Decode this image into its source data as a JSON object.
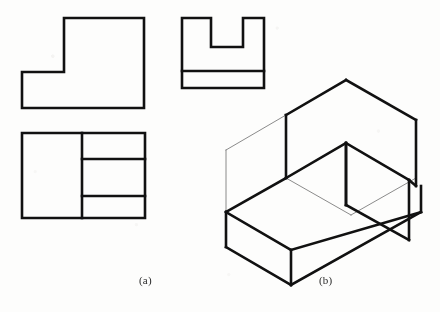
{
  "figure": {
    "kind": "engineering-drawing",
    "background_color": "#fdfdfc",
    "line_color": "#111111",
    "thick_stroke": 2.6,
    "thin_stroke": 0.8
  },
  "captions": {
    "a": "(a)",
    "b": "(b)"
  },
  "orthographic_views": {
    "front_view": {
      "name": "front-view-L-shape",
      "outline_points": "22,72 22,108 144,108 144,18 64,18 64,72",
      "closed": true
    },
    "side_view": {
      "name": "side-view-U-shape",
      "outline_points": "182,18 182,88 264,88 264,18 243,18 243,47 211,47 211,18",
      "closed": true,
      "internal_lines": [
        {
          "name": "horizontal-divider",
          "points": "182,71 264,71"
        }
      ]
    },
    "top_view": {
      "name": "top-view-rectangle",
      "outline_points": "22,133 145,133 145,218 22,218",
      "closed": true,
      "internal_lines": [
        {
          "name": "vertical-divider",
          "points": "82,133 82,218"
        },
        {
          "name": "horizontal-line-upper",
          "points": "82,159 145,159"
        },
        {
          "name": "horizontal-line-lower",
          "points": "82,196 145,196"
        }
      ]
    }
  },
  "isometric_view": {
    "name": "isometric-block-with-slot",
    "solid_edges": [
      {
        "name": "top-rear-left-edge",
        "points": "286,115 346,80"
      },
      {
        "name": "top-ridge-upper",
        "points": "346,80 416,120"
      },
      {
        "name": "slot-top-left-front",
        "points": "286,115 286,178"
      },
      {
        "name": "slot-inner-floor-left",
        "points": "286,178 346,143"
      },
      {
        "name": "slot-rib-front-face",
        "points": "346,143 346,205"
      },
      {
        "name": "slot-inner-right-wall",
        "points": "346,143 409,180"
      },
      {
        "name": "rib-right-bottom",
        "points": "346,205 409,240"
      },
      {
        "name": "top-right-outer",
        "points": "416,120 416,186"
      },
      {
        "name": "right-outer-lower",
        "points": "409,180 416,186"
      },
      {
        "name": "ledge-front-top",
        "points": "286,178 226,212"
      },
      {
        "name": "ledge-left-vertical",
        "points": "226,212 226,247"
      },
      {
        "name": "base-front-lower-left",
        "points": "226,247 291,285"
      },
      {
        "name": "base-front-lower-right",
        "points": "291,285 421,212"
      },
      {
        "name": "base-right-vertical",
        "points": "421,212 421,186"
      },
      {
        "name": "ledge-front-right",
        "points": "291,250 421,212"
      },
      {
        "name": "ledge-front-middle",
        "points": "226,212 291,250"
      },
      {
        "name": "ledge-step-vertical",
        "points": "291,250 291,285"
      },
      {
        "name": "rib-vertical-inner",
        "points": "409,180 409,240"
      },
      {
        "name": "rib-left-front",
        "points": "346,205 346,143"
      }
    ],
    "construction_edges": [
      {
        "name": "box-top-rear-left",
        "points": "286,115 226,150"
      },
      {
        "name": "box-rear-vertical",
        "points": "226,150 226,212"
      },
      {
        "name": "box-top-rear-right",
        "points": "346,80 416,120"
      },
      {
        "name": "box-hidden-floor",
        "points": "226,212 291,250"
      },
      {
        "name": "box-hidden-diagonal",
        "points": "286,178 351,215"
      },
      {
        "name": "box-hidden-right",
        "points": "351,215 416,178"
      },
      {
        "name": "box-rear-top-join",
        "points": "286,115 346,80"
      }
    ]
  }
}
